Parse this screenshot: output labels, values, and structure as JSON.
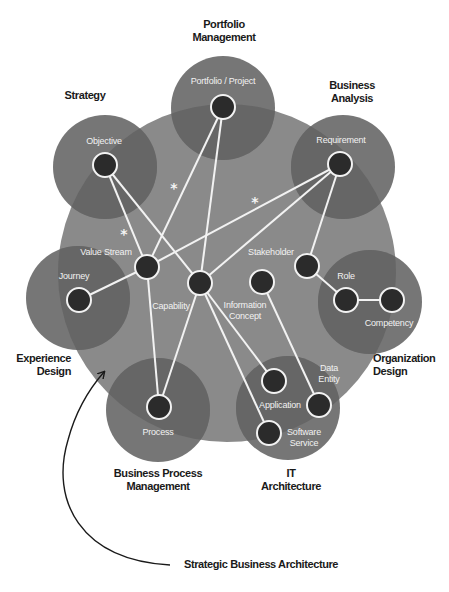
{
  "title": "Strategic Business Architecture",
  "colors": {
    "core": "#8a8a8a",
    "domain": "#767676",
    "overlap": "#666666",
    "node_fill": "#2b2b2b",
    "node_stroke": "#f2f2f2",
    "line": "#f2f2f2",
    "text_dark": "#1a1a1a"
  },
  "core_circle": {
    "cx": 227,
    "cy": 273,
    "r": 169
  },
  "domains": [
    {
      "id": "portfolio",
      "label": "Portfolio\nManagement",
      "line1": "Portfolio",
      "line2": "Management",
      "cx": 223,
      "cy": 108,
      "r": 52
    },
    {
      "id": "strategy",
      "label": "Strategy",
      "line1": "Strategy",
      "line2": "",
      "cx": 105,
      "cy": 167,
      "r": 52
    },
    {
      "id": "business-analysis",
      "label": "Business\nAnalysis",
      "line1": "Business",
      "line2": "Analysis",
      "cx": 343,
      "cy": 167,
      "r": 52
    },
    {
      "id": "experience",
      "label": "Experience\nDesign",
      "line1": "Experience",
      "line2": "Design",
      "cx": 78,
      "cy": 298,
      "r": 52
    },
    {
      "id": "organization",
      "label": "Organization\nDesign",
      "line1": "Organization",
      "line2": "Design",
      "cx": 370,
      "cy": 302,
      "r": 52
    },
    {
      "id": "bpm",
      "label": "Business Process\nManagement",
      "line1": "Business Process",
      "line2": "Management",
      "cx": 158,
      "cy": 410,
      "r": 52
    },
    {
      "id": "it",
      "label": "IT\nArchitecture",
      "line1": "IT",
      "line2": "Architecture",
      "cx": 288,
      "cy": 408,
      "r": 52
    }
  ],
  "nodes": [
    {
      "id": "portfolio-project",
      "label": "Portfolio / Project",
      "x": 223,
      "y": 107
    },
    {
      "id": "objective",
      "label": "Objective",
      "x": 105,
      "y": 165
    },
    {
      "id": "requirement",
      "label": "Requirement",
      "x": 340,
      "y": 164
    },
    {
      "id": "value-stream",
      "label": "Value Stream",
      "x": 147,
      "y": 267
    },
    {
      "id": "capability",
      "label": "Capability",
      "x": 200,
      "y": 283
    },
    {
      "id": "information-concept",
      "label": "Information Concept",
      "x": 262,
      "y": 282
    },
    {
      "id": "stakeholder",
      "label": "Stakeholder",
      "x": 307,
      "y": 266
    },
    {
      "id": "journey",
      "label": "Journey",
      "x": 79,
      "y": 300
    },
    {
      "id": "role",
      "label": "Role",
      "x": 346,
      "y": 300
    },
    {
      "id": "competency",
      "label": "Competency",
      "x": 392,
      "y": 300
    },
    {
      "id": "process",
      "label": "Process",
      "x": 159,
      "y": 407
    },
    {
      "id": "application",
      "label": "Application",
      "x": 274,
      "y": 381
    },
    {
      "id": "data-entity",
      "label": "Data Entity",
      "x": 319,
      "y": 405
    },
    {
      "id": "software-service",
      "label": "Software Service",
      "x": 269,
      "y": 433
    }
  ],
  "node_labels": {
    "portfolio_project": "Portfolio / Project",
    "objective": "Objective",
    "requirement": "Requirement",
    "value_stream": "Value Stream",
    "capability": "Capability",
    "information_concept_1": "Information",
    "information_concept_2": "Concept",
    "stakeholder": "Stakeholder",
    "journey": "Journey",
    "role": "Role",
    "competency": "Competency",
    "process": "Process",
    "application": "Application",
    "data_entity_1": "Data",
    "data_entity_2": "Entity",
    "software_service_1": "Software",
    "software_service_2": "Service"
  },
  "domain_labels": {
    "portfolio_1": "Portfolio",
    "portfolio_2": "Management",
    "strategy": "Strategy",
    "ba_1": "Business",
    "ba_2": "Analysis",
    "experience_1": "Experience",
    "experience_2": "Design",
    "organization_1": "Organization",
    "organization_2": "Design",
    "bpm_1": "Business Process",
    "bpm_2": "Management",
    "it_1": "IT",
    "it_2": "Architecture"
  },
  "edges": [
    [
      "objective",
      "value-stream"
    ],
    [
      "objective",
      "capability"
    ],
    [
      "portfolio-project",
      "value-stream"
    ],
    [
      "portfolio-project",
      "capability"
    ],
    [
      "requirement",
      "value-stream"
    ],
    [
      "requirement",
      "capability"
    ],
    [
      "requirement",
      "stakeholder"
    ],
    [
      "journey",
      "value-stream"
    ],
    [
      "value-stream",
      "process"
    ],
    [
      "capability",
      "process"
    ],
    [
      "capability",
      "application"
    ],
    [
      "capability",
      "software-service"
    ],
    [
      "information-concept",
      "data-entity"
    ],
    [
      "stakeholder",
      "role"
    ],
    [
      "role",
      "competency"
    ]
  ],
  "asterisks": [
    {
      "symbol": "*",
      "x": 174,
      "y": 187
    },
    {
      "symbol": "*",
      "x": 255,
      "y": 201
    },
    {
      "symbol": "*",
      "x": 124,
      "y": 233
    }
  ],
  "caption": {
    "text": "Strategic Business Architecture",
    "x": 254,
    "y": 564
  }
}
